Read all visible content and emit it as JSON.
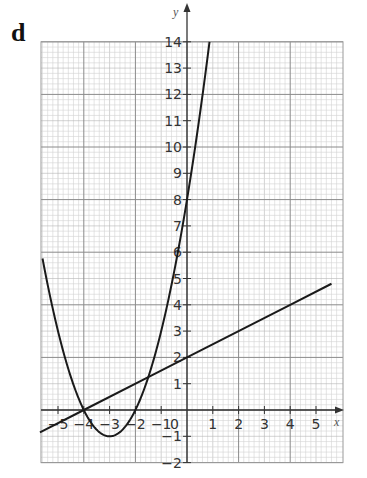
{
  "panel_label": "d",
  "chart_data": {
    "type": "line",
    "title": "",
    "xlabel": "x",
    "ylabel": "y",
    "xlim": [
      -5.7,
      5.9
    ],
    "ylim": [
      -2,
      14
    ],
    "grid": true,
    "x_ticks": [
      -5,
      -4,
      -3,
      -2,
      -1,
      0,
      1,
      2,
      3,
      4,
      5
    ],
    "x_tick_labels": [
      "-5",
      "-4",
      "-3",
      "-2",
      "-1",
      "0",
      "1",
      "2",
      "3",
      "4",
      "5"
    ],
    "y_ticks": [
      -2,
      -1,
      1,
      2,
      3,
      4,
      5,
      6,
      7,
      8,
      9,
      10,
      11,
      12,
      13,
      14
    ],
    "y_tick_labels": [
      "-2",
      "-1",
      "1",
      "2",
      "3",
      "4",
      "5",
      "6",
      "7",
      "8",
      "9",
      "10",
      "11",
      "12",
      "13",
      "14"
    ],
    "series": [
      {
        "name": "parabola y = x^2 + 6x + 8",
        "x": [
          -5.6,
          -5,
          -4.5,
          -4,
          -3.5,
          -3,
          -2.5,
          -2,
          -1.5,
          -1,
          -0.5,
          0,
          0.5,
          0.873
        ],
        "values": [
          5.76,
          3,
          1.25,
          0,
          -0.75,
          -1,
          -0.75,
          0,
          1.25,
          3,
          5.25,
          8,
          11.25,
          14
        ]
      },
      {
        "name": "line y = 0.5x + 2",
        "x": [
          -5.7,
          -4,
          -1.5,
          0,
          4,
          5.6
        ],
        "values": [
          -0.85,
          0,
          1.25,
          2,
          4,
          4.8
        ]
      }
    ],
    "annotations": {
      "intersections": [
        [
          -4,
          0
        ],
        [
          -1.5,
          1.25
        ]
      ],
      "parabola_vertex": [
        -3,
        -1
      ],
      "parabola_roots": [
        -4,
        -2
      ]
    }
  }
}
